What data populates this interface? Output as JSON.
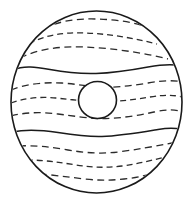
{
  "artwork": {
    "title": "Jupiter",
    "subject": "planet-jupiter-line-drawing",
    "style": "black-and-white line art / coloring-book outline",
    "background_color": "#ffffff",
    "line_color": "#1a1a1a",
    "dash_color": "#2b2b2b",
    "canvas": {
      "width": 193,
      "height": 206
    }
  },
  "planet": {
    "name": "planet-body",
    "shape": "circle",
    "center_x": 96.5,
    "center_y": 102,
    "radius_x": 85.5,
    "radius_y": 91,
    "fill": "#ffffff",
    "stroke": "#1a1a1a",
    "stroke_width": 1.6
  },
  "great_red_spot": {
    "name": "great-red-spot",
    "shape": "oval",
    "center_x": 97.5,
    "center_y": 100,
    "radius_x": 19,
    "radius_y": 18.5,
    "fill": "#ffffff",
    "stroke": "#1a1a1a",
    "stroke_width": 1.6
  },
  "bands": [
    {
      "id": "band-north-polar-1",
      "style": "dashed",
      "latitude_y": 22,
      "region": "north"
    },
    {
      "id": "band-north-polar-2",
      "style": "dashed",
      "latitude_y": 37,
      "region": "north"
    },
    {
      "id": "band-north-temperate",
      "style": "dashed",
      "latitude_y": 52,
      "region": "north"
    },
    {
      "id": "band-north-belt-edge",
      "style": "solid",
      "latitude_y": 70,
      "region": "north-equatorial"
    },
    {
      "id": "band-equatorial-1",
      "style": "dashed",
      "latitude_y": 86,
      "region": "equatorial"
    },
    {
      "id": "band-equatorial-2",
      "style": "dashed",
      "latitude_y": 101,
      "region": "equatorial"
    },
    {
      "id": "band-equatorial-3",
      "style": "dashed",
      "latitude_y": 117,
      "region": "equatorial"
    },
    {
      "id": "band-south-belt-edge",
      "style": "solid",
      "latitude_y": 135,
      "region": "south-equatorial"
    },
    {
      "id": "band-south-temperate",
      "style": "dashed",
      "latitude_y": 150,
      "region": "south"
    },
    {
      "id": "band-south-polar-1",
      "style": "dashed",
      "latitude_y": 164,
      "region": "south"
    },
    {
      "id": "band-south-polar-2",
      "style": "dashed",
      "latitude_y": 178,
      "region": "south"
    }
  ],
  "counts": {
    "total_bands": 11,
    "solid_bands": 2,
    "dashed_bands": 9,
    "spots": 1
  }
}
